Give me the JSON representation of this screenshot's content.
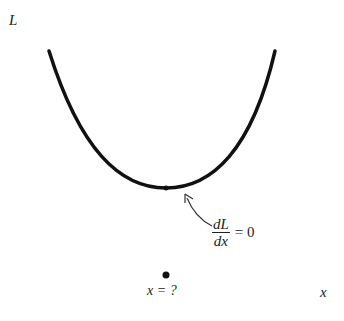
{
  "diagram": {
    "y_axis_label": "L",
    "x_axis_label": "x",
    "derivative_num": "dL",
    "derivative_den": "dx",
    "derivative_eq": "= 0",
    "minimum_label": "x = ?",
    "curve_color": "#111111"
  }
}
